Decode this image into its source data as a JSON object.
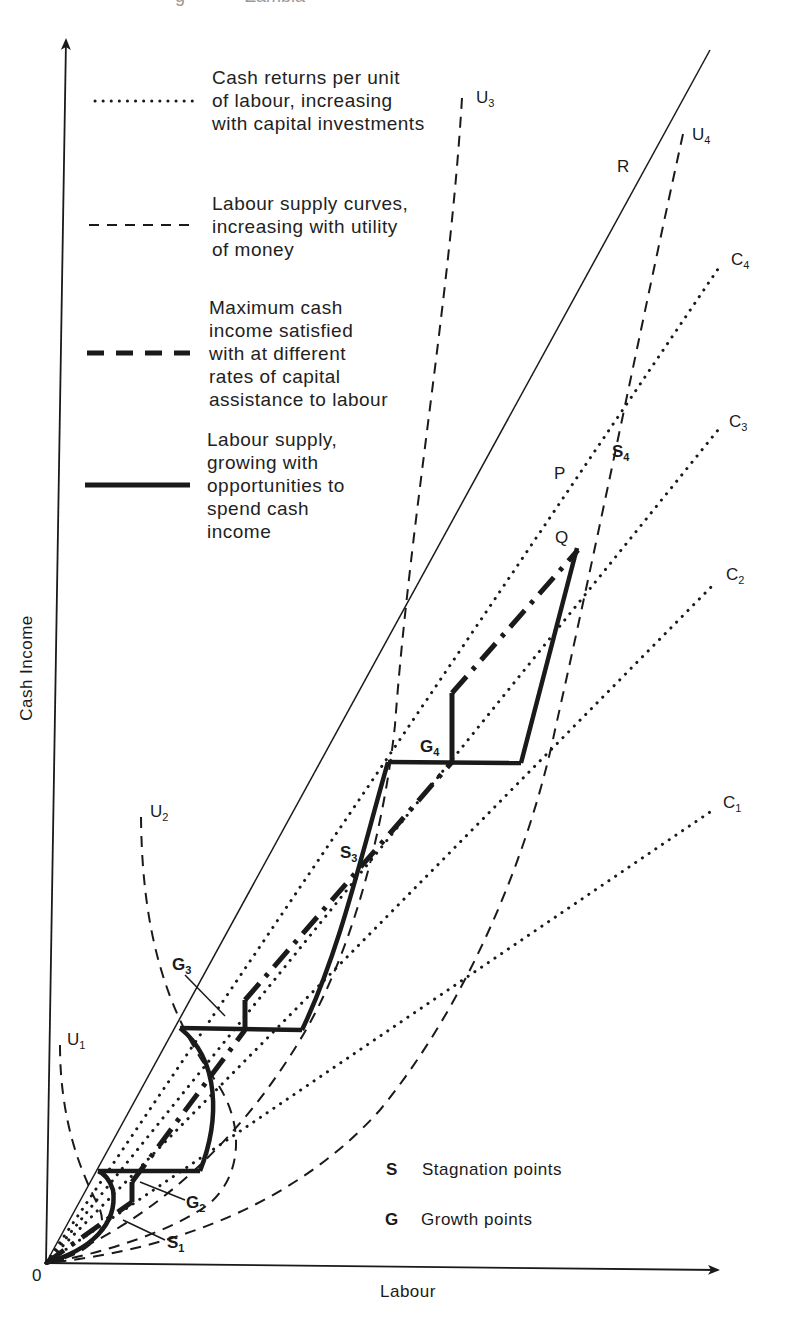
{
  "figure": {
    "title_fragment_left": "g",
    "title_fragment_right": "Zambia",
    "axes": {
      "y_label": "Cash Income",
      "x_label": "Labour",
      "origin_label": "0"
    },
    "legend": [
      {
        "style": "dotted",
        "lines": [
          "Cash returns per unit",
          "of labour, increasing",
          "with capital investments"
        ]
      },
      {
        "style": "dashed-thin",
        "lines": [
          "Labour supply curves,",
          "increasing with utility",
          "of money"
        ]
      },
      {
        "style": "dashed-thick",
        "lines": [
          "Maximum cash",
          "income satisfied",
          "with at different",
          "rates of capital",
          "assistance to labour"
        ]
      },
      {
        "style": "solid-thick",
        "lines": [
          "Labour supply,",
          "growing with",
          "opportunities to",
          "spend cash",
          "income"
        ]
      }
    ],
    "key": {
      "s": {
        "letter": "S",
        "text": "Stagnation points"
      },
      "g": {
        "letter": "G",
        "text": "Growth points"
      }
    },
    "curve_labels": {
      "u1": {
        "base": "U",
        "sub": "1"
      },
      "u2": {
        "base": "U",
        "sub": "2"
      },
      "u3": {
        "base": "U",
        "sub": "3"
      },
      "u4": {
        "base": "U",
        "sub": "4"
      },
      "c1": {
        "base": "C",
        "sub": "1"
      },
      "c2": {
        "base": "C",
        "sub": "2"
      },
      "c3": {
        "base": "C",
        "sub": "3"
      },
      "c4": {
        "base": "C",
        "sub": "4"
      },
      "r": "R",
      "p": "P",
      "q": "Q"
    },
    "point_labels": {
      "s1": {
        "base": "S",
        "sub": "1"
      },
      "s3": {
        "base": "S",
        "sub": "3"
      },
      "s4": {
        "base": "S",
        "sub": "4"
      },
      "g2": {
        "base": "G",
        "sub": "2"
      },
      "g3": {
        "base": "G",
        "sub": "3"
      },
      "g4": {
        "base": "G",
        "sub": "4"
      }
    },
    "colors": {
      "ink": "#1a1a1a",
      "background": "#ffffff"
    }
  }
}
